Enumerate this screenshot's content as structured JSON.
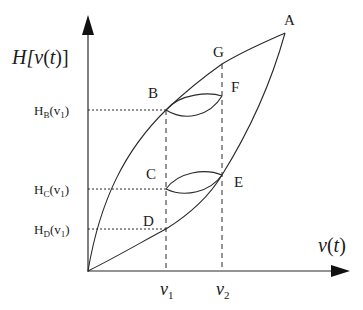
{
  "diagram": {
    "type": "hysteresis-loop",
    "y_axis_label": {
      "main": "H[",
      "v": "v",
      "paren_open": "(",
      "t": "t",
      "paren_close": ")]"
    },
    "x_axis_label": {
      "v": "v",
      "paren_open": "(",
      "t": "t",
      "paren_close": ")"
    },
    "points": {
      "A": "A",
      "B": "B",
      "C": "C",
      "D": "D",
      "E": "E",
      "F": "F",
      "G": "G"
    },
    "y_ticks": [
      {
        "H": "H",
        "sub": "B",
        "arg_open": "(v",
        "arg_sub": "1",
        "arg_close": ")"
      },
      {
        "H": "H",
        "sub": "C",
        "arg_open": "(v",
        "arg_sub": "1",
        "arg_close": ")"
      },
      {
        "H": "H",
        "sub": "D",
        "arg_open": "(v",
        "arg_sub": "1",
        "arg_close": ")"
      }
    ],
    "x_ticks": [
      {
        "v": "v",
        "sub": "1"
      },
      {
        "v": "v",
        "sub": "2"
      }
    ],
    "colors": {
      "stroke": "#2a2a2a",
      "background": "#ffffff"
    }
  }
}
